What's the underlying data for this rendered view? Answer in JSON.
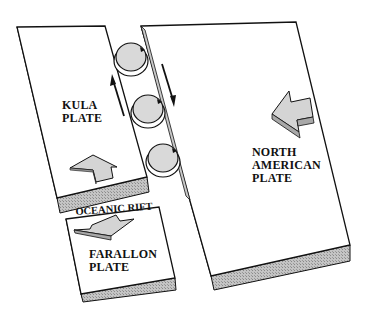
{
  "diagram": {
    "type": "plate-tectonics-illustration",
    "labels": {
      "kula": [
        "KULA",
        "PLATE"
      ],
      "north_american": [
        "NORTH",
        "AMERICAN",
        "PLATE"
      ],
      "farallon": [
        "FARALLON",
        "PLATE"
      ],
      "rift": "OCEANIC RIFT"
    },
    "elements": {
      "plates": [
        "Kula Plate",
        "North American Plate",
        "Farallon Plate"
      ],
      "ball_bearings_count": 3,
      "arrows": [
        {
          "on": "Kula Plate",
          "direction": "up"
        },
        {
          "on": "North American Plate",
          "direction": "left"
        },
        {
          "on": "Farallon Plate",
          "direction": "down"
        },
        {
          "on": "transform fault left side",
          "direction": "up"
        },
        {
          "on": "transform fault right side",
          "direction": "down"
        }
      ]
    },
    "colors": {
      "plate_top": "#ffffff",
      "plate_edge": "#b8b8b8",
      "arrow_fill": "#d4d4d4",
      "ball_fill": "#d9d9d9",
      "outline": "#111111"
    }
  }
}
